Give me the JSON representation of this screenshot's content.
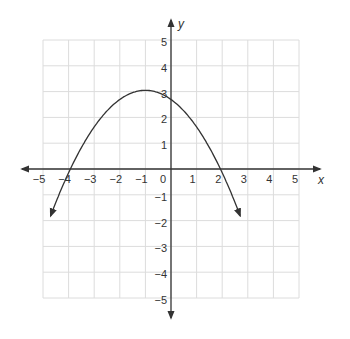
{
  "chart_data": {
    "type": "line",
    "title": "",
    "xlabel": "x",
    "ylabel": "y",
    "xlim": [
      -5,
      5
    ],
    "ylim": [
      -5,
      5
    ],
    "grid": true,
    "x_ticks": [
      "-5",
      "-4",
      "-3",
      "-2",
      "-1",
      "0",
      "1",
      "2",
      "3",
      "4",
      "5"
    ],
    "y_ticks": [
      "5",
      "4",
      "3",
      "2",
      "1",
      "-1",
      "-2",
      "-3",
      "-4",
      "-5"
    ],
    "series": [
      {
        "name": "parabola",
        "equation": "y = -(1/3)(x + 4)(x - 2)",
        "vertex": [
          -1,
          3
        ],
        "x_intercepts": [
          -4,
          2
        ],
        "y_intercept": 2.7,
        "opens": "down",
        "arrows_at_ends": true,
        "x": [
          -4.7,
          -4,
          -3,
          -2,
          -1,
          0,
          1,
          2,
          2.7
        ],
        "y": [
          -2.2,
          0,
          1.7,
          2.7,
          3.0,
          2.7,
          1.7,
          0,
          -2.2
        ]
      }
    ],
    "colors": {
      "grid": "#d9d9d9",
      "axis": "#333333",
      "curve": "#333333"
    }
  }
}
